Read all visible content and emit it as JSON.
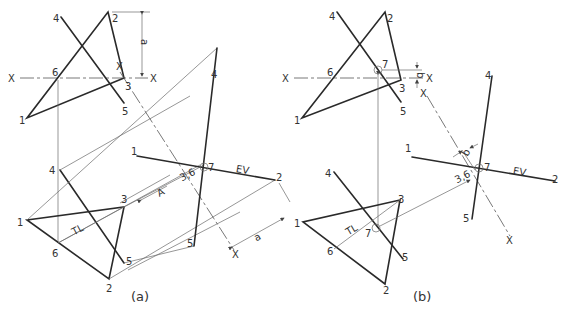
{
  "figure_a": {
    "caption": "(a)",
    "top_view": {
      "points": {
        "1": "1",
        "2": "2",
        "3": "3",
        "4": "4",
        "5": "5",
        "6": "6"
      },
      "fold_line_labels": [
        "X",
        "X"
      ],
      "dimension": "a"
    },
    "front_view": {
      "points": {
        "1": "1",
        "2": "2",
        "3": "3",
        "4": "4",
        "5": "5",
        "6": "6"
      },
      "true_length_label": "TL",
      "direction_label": "A"
    },
    "aux_view": {
      "points": {
        "1": "1",
        "2": "2",
        "4": "4",
        "5": "5",
        "7": "7",
        "36": "3,6"
      },
      "edge_view_label": "EV",
      "fold_line_labels": [
        "X",
        "X"
      ],
      "dimension": "a"
    }
  },
  "figure_b": {
    "caption": "(b)",
    "top_view": {
      "points": {
        "1": "1",
        "2": "2",
        "3": "3",
        "4": "4",
        "5": "5",
        "6": "6",
        "7": "7"
      },
      "fold_line_labels": [
        "X",
        "X"
      ],
      "dimension": "b"
    },
    "front_view": {
      "points": {
        "1": "1",
        "2": "2",
        "3": "3",
        "4": "4",
        "5": "5",
        "6": "6",
        "7": "7"
      },
      "true_length_label": "TL"
    },
    "aux_view": {
      "points": {
        "1": "1",
        "2": "2",
        "4": "4",
        "5": "5",
        "7": "7",
        "36": "3,6"
      },
      "edge_view_label": "EV",
      "fold_line_labels": [
        "X",
        "X"
      ],
      "dimension": "b"
    }
  }
}
